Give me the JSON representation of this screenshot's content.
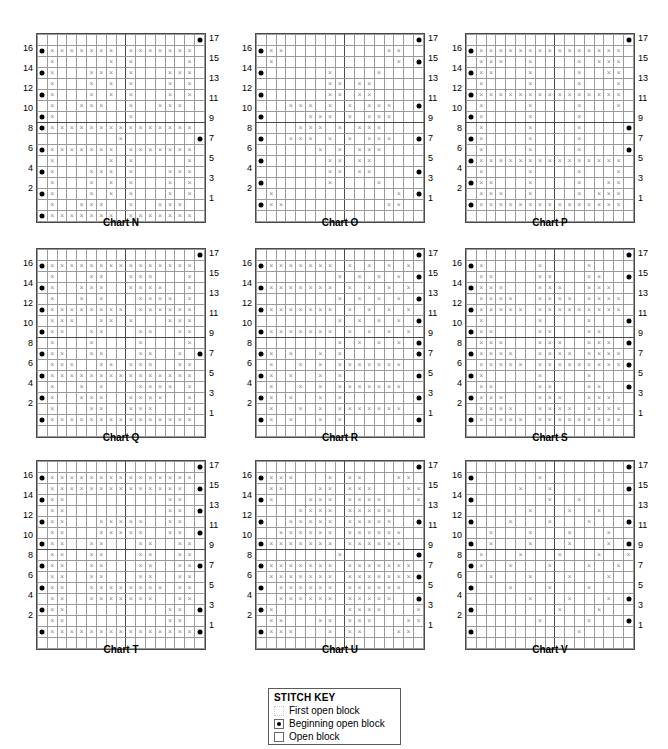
{
  "page": {
    "grid_rows": 17,
    "grid_cols": 17,
    "row_labels_left": [
      16,
      14,
      12,
      10,
      8,
      6,
      4,
      2
    ],
    "row_labels_right": [
      17,
      15,
      13,
      11,
      9,
      7,
      5,
      3,
      1
    ],
    "heavy_divider_col": 8,
    "heavy_divider_row_from_top": 7,
    "colors": {
      "grid_line": "#9a9a9a",
      "heavy_line": "#4a4a4a",
      "mark": "#8a8a8a",
      "dot": "#000000",
      "background": "#ffffff"
    }
  },
  "stitch_key": {
    "title": "STITCH KEY",
    "items": [
      {
        "icon": "dotted-square-icon",
        "label": "First open block"
      },
      {
        "icon": "filled-dot-square-icon",
        "label": "Beginning open block"
      },
      {
        "icon": "open-square-icon",
        "label": "Open block"
      }
    ]
  },
  "charts": [
    {
      "id": "chart-n",
      "caption": "Chart N",
      "left": 36,
      "top": 33,
      "rows": [
        "................d",
        "dxxxxxxx.xxxxxxx.",
        ".x.....x.x.....x.",
        "dx...xxx.x...xxx.",
        ".x...x.x.x...x.x.",
        "dx...x.x.x...x.x.",
        ".x..xxx..x..xxx..",
        "dx.......x.......",
        "dxxxxxxxxxxxxxxx.",
        "........x.......d",
        "dxxxxxxx.xxxxxxx.",
        ".x.....x.x.....x.",
        "dx...xxx.x...xxx.",
        ".x...x.x.x...x.x.",
        "dx...x.x.x...x.x.",
        ".x..xxx..x..xxx..",
        "dxxxxxxx.xxxxxxx."
      ]
    },
    {
      "id": "chart-o",
      "caption": "Chart O",
      "left": 255,
      "top": 33,
      "rows": [
        "................d",
        "dxx..........xx..",
        ".x............x.d",
        "d......x....x....",
        ".......xx.xx.....",
        "d......xx.xx.....",
        "...xxx.x.x.xxx..d",
        "d....xxx.x.xxx...",
        "....xxx.x.xxx....",
        "d..xxx.x.x.xxx..d",
        "......x.x.xxx....",
        "d......xx.xx.....",
        ".......xx.xx....d",
        "d......x....x....",
        ".x............x.d",
        "dxx..........xx..",
        "................."
      ]
    },
    {
      "id": "chart-p",
      "caption": "Chart P",
      "left": 465,
      "top": 33,
      "rows": [
        "................d",
        "dxxxxxxxxxxxxxxx.",
        ".xxx..x....x.xxx.",
        "dxx...x....x..xx.",
        ".x....x....x...x.",
        "dxxxxxxxxxxxxxxx.",
        ".x....x....x...x.",
        "dx....x....x.....",
        ".x....x....x....d",
        "dx....x....x.....",
        ".x....x....x....d",
        "dxxxxxxxxxxxxxxx.",
        ".x....x....x...x.",
        "dxx...x....x..xx.",
        ".xxx..x....x.xxx.",
        "dxxxxxxxxxxxxxxx.",
        "................."
      ]
    },
    {
      "id": "chart-q",
      "caption": "Chart Q",
      "left": 36,
      "top": 248,
      "rows": [
        "................d",
        "dxxxxxxxxxxxxxxx.",
        ".x...xx..xxx...x.",
        "dx..xxx..xxxx..x.",
        ".x..x.x...xxxx.x.",
        "dxxxxxxxx.xxxxxx.",
        ".xxx..xx.x...xxx.",
        "dxx..xx...xx..xx.",
        ".x...x....x....x.",
        "dxx..xx...xx..x.d",
        ".xxx..xx.xxx..xx.",
        "dxxxxxxxxxxxxxxx.",
        ".x..x.x...xxxx.x.",
        "dx..xxx..xxxx..x.",
        ".x...xx..xxx...x.",
        "dxxxxxxxxxxxxxxx.",
        "................."
      ]
    },
    {
      "id": "chart-r",
      "caption": "Chart R",
      "left": 255,
      "top": 248,
      "rows": [
        "................d",
        "dxxxxxxx.x.x.x.x.",
        "........x.x.x.x.d",
        "dxxxxxxx.x.x.x.x.",
        "........x.x.x.x.d",
        "dxxxxxxx.x.x.x.x.",
        "........x.x.x.x.d",
        "dxxxxxxx.x.x.x.x.",
        "........x.x.x.x.d",
        "dx.x..x.x.......d",
        ".x..x.x.xxxxxxx..",
        "dx.x..x.x.......d",
        ".x..x.x.xxxxxxx..",
        "dx.x..x.x.......d",
        ".x..x.x.xxxxxxx..",
        "dx.x..x.x.......d",
        "................."
      ]
    },
    {
      "id": "chart-s",
      "caption": "Chart S",
      "left": 465,
      "top": 248,
      "rows": [
        "................d",
        "dx.....x....x....",
        ".xx....xx...xx..d",
        "dxxx...xxx..xxx..",
        ".xxxx..xxxx.xxxx d",
        "dxxxxx.xxxxxxxxx.",
        ".x.....x....x...d",
        "dxx....xx...xx...",
        ".xxx...xxx..xxx.d",
        "dxxxx..xxxx.xxxx.",
        ".xxxxx.xxxxxxxxxd",
        "dx.....x....x....",
        ".xx....xx...xx..d",
        "dxxx...xxx..xxx..",
        ".xxxx..xxxx.xxxx d",
        "dxxxxx.xxxxxxxxx.",
        "................."
      ]
    },
    {
      "id": "chart-t",
      "caption": "Chart T",
      "left": 36,
      "top": 460,
      "rows": [
        "................d",
        "dxxxxxxxxxxxxxxx.",
        ".xxxxxxxxxxxxxx.d",
        "dxx..........xx..",
        ".xx..........xx.d",
        "dxx...xxxxx..xx..",
        ".xx...xxxxx..xx d",
        "dxx..xx...xx..xx.",
        ".xx..xx...xx..xx.",
        "dxx..xx...xx..xxd",
        ".xx..xx...xx..xx.",
        "dxx..xxxxxxxx.xx.",
        ".xx..xxxxxxx..xx.",
        "dxx..........xx.d",
        ".xx..........xx..",
        "dxxxxxxxxxxxxxxxd",
        "................."
      ]
    },
    {
      "id": "chart-u",
      "caption": "Chart U",
      "left": 255,
      "top": 460,
      "rows": [
        "................d",
        "dxxx...x.xx...xx.",
        ".xx...xx.xxx...xx",
        "dx...xxx.xxxx...x",
        "....xxxx.xxxxx...",
        "d..xxxxx.xxxxx..d",
        "..xxxxxx.xxxxxx..",
        "dxxxxxxx.xxxxxx..",
        "........x.......d",
        "dxxxxxxx.xxxxxxx.",
        ".xxxxxxx.xxxxxxxd",
        "d.xxxxxx.xxxxxx..",
        "..xxxxxx.xxxxx..d",
        "dx.......xxxx...x",
        ".xx...xx.xxx...xx",
        "dxxx...x.xx...xx.",
        "................."
      ]
    },
    {
      "id": "chart-v",
      "caption": "Chart V",
      "left": 465,
      "top": 460,
      "rows": [
        "................d",
        "d......x.........",
        ".....x..x.......d",
        "d.......x..x.....",
        "......x...x..x...",
        "d...x...x...x...d",
        "..x...x...x...x..",
        "d.x...x...x...x.d",
        ".x...x...x...x..x",
        "dx..x...x...x..x.",
        "..x...x...x...x..",
        "d...x...x...x....",
        "......x...x...x.d",
        "d........x...x...",
        ".......x....x...d",
        "d..........x.....",
        "................."
      ]
    }
  ]
}
